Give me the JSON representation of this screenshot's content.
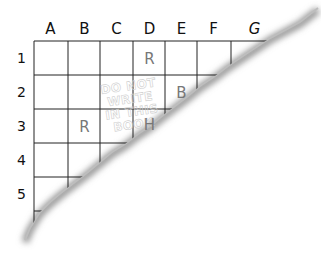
{
  "grid": {
    "columns": [
      "A",
      "B",
      "C",
      "D",
      "E",
      "F",
      "G"
    ],
    "rows": [
      "1",
      "2",
      "3",
      "4",
      "5"
    ],
    "cells": [
      {
        "row": "1",
        "col": "D",
        "value": "R"
      },
      {
        "row": "2",
        "col": "E",
        "value": "B"
      },
      {
        "row": "3",
        "col": "B",
        "value": "R"
      },
      {
        "row": "3",
        "col": "D",
        "value": "H"
      }
    ]
  },
  "watermark": {
    "line1": "DO NOT WRITE",
    "line2": "IN THIS BOOK"
  },
  "colors": {
    "grid_line": "#222222",
    "letter": "#777777",
    "watermark": "#cfcfcf",
    "tear_shadow": "#9a9a9a"
  }
}
